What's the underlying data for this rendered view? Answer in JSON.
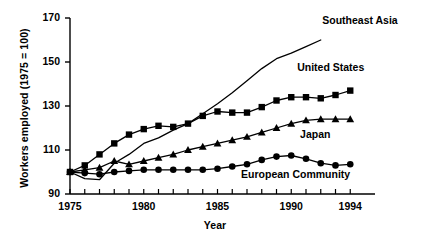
{
  "chart_data": {
    "type": "line",
    "title": "",
    "xlabel": "Year",
    "ylabel": "Workers employed (1975 = 100)",
    "xlim": [
      1975,
      1995
    ],
    "ylim": [
      90,
      170
    ],
    "yticks": [
      90,
      110,
      130,
      150,
      170
    ],
    "ytick_labels": [
      "90",
      "110",
      "130",
      "150",
      "170"
    ],
    "xticks": [
      1975,
      1976,
      1977,
      1978,
      1979,
      1980,
      1981,
      1982,
      1983,
      1984,
      1985,
      1986,
      1987,
      1988,
      1989,
      1990,
      1991,
      1992,
      1993,
      1994
    ],
    "xtick_labels_shown": [
      "1975",
      "1980",
      "1985",
      "1990",
      "1994"
    ],
    "xtick_labels_shown_at": [
      1975,
      1980,
      1985,
      1990,
      1994
    ],
    "grid": false,
    "legend_position": "inline-right",
    "series": [
      {
        "name": "Southeast Asia",
        "marker": "none",
        "label_x": 1992.1,
        "label_y": 168.5,
        "x": [
          1975,
          1976,
          1977,
          1978,
          1979,
          1980,
          1981,
          1982,
          1983,
          1984,
          1985,
          1986,
          1987,
          1988,
          1989,
          1990,
          1991,
          1992
        ],
        "values": [
          100,
          97,
          96.5,
          104,
          108,
          113,
          115.5,
          119,
          122,
          126.5,
          131,
          136,
          141.5,
          147,
          151.5,
          154,
          157,
          160
        ]
      },
      {
        "name": "United States",
        "marker": "square",
        "label_x": 1990.4,
        "label_y": 147.5,
        "x": [
          1975,
          1976,
          1977,
          1978,
          1979,
          1980,
          1981,
          1982,
          1983,
          1984,
          1985,
          1986,
          1987,
          1988,
          1989,
          1990,
          1991,
          1992,
          1993,
          1994
        ],
        "values": [
          100,
          103,
          108,
          113,
          117,
          119.5,
          121,
          120.5,
          122,
          125.5,
          127.5,
          127,
          127,
          129.5,
          132.5,
          134,
          134,
          133.5,
          135,
          137
        ]
      },
      {
        "name": "Japan",
        "marker": "triangle",
        "label_x": 1990.6,
        "label_y": 117,
        "x": [
          1975,
          1976,
          1977,
          1978,
          1979,
          1980,
          1981,
          1982,
          1983,
          1984,
          1985,
          1986,
          1987,
          1988,
          1989,
          1990,
          1991,
          1992,
          1993,
          1994
        ],
        "values": [
          100,
          101,
          102,
          105,
          103.5,
          105,
          106.5,
          108,
          110,
          111.5,
          113,
          114.5,
          116,
          118,
          120,
          122,
          123.5,
          124,
          124,
          124
        ]
      },
      {
        "name": "European Community",
        "marker": "circle",
        "label_x": 1986.6,
        "label_y": 98.5,
        "x": [
          1975,
          1976,
          1977,
          1978,
          1979,
          1980,
          1981,
          1982,
          1983,
          1984,
          1985,
          1986,
          1987,
          1988,
          1989,
          1990,
          1991,
          1992,
          1993,
          1994
        ],
        "values": [
          100,
          99.5,
          99,
          100,
          100.5,
          101,
          101,
          101,
          101,
          101,
          101.5,
          102.5,
          103.5,
          105.5,
          107,
          107.5,
          106,
          104,
          103,
          103.5
        ]
      }
    ]
  }
}
